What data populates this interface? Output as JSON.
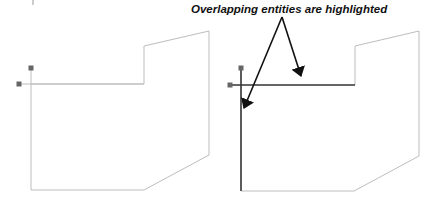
{
  "caption": "Overlapping entities are highlighted",
  "colors": {
    "normal_line": "#bdbdbd",
    "highlight_line": "#333333",
    "grip": "#666666",
    "arrow": "#111111",
    "background": "#ffffff"
  },
  "panels": [
    {
      "name": "before",
      "outline_points": "31,84 144,84 144,46 209,31 209,155 144,190 31,190",
      "vertical_line": {
        "x": 31,
        "y1": 70,
        "y2": 190
      },
      "horizontal_line": {
        "x1": 21,
        "x2": 144,
        "y": 84
      },
      "grips": [
        {
          "x": 31,
          "y": 68
        },
        {
          "x": 19,
          "y": 84
        }
      ],
      "highlighted": false
    },
    {
      "name": "after",
      "outline_points": "355,85 355,46 419,31 419,156 354,191 241,191",
      "vertical_line": {
        "x": 241,
        "y1": 70,
        "y2": 191
      },
      "horizontal_line": {
        "x1": 232,
        "x2": 355,
        "y": 85
      },
      "grips": [
        {
          "x": 241,
          "y": 68
        },
        {
          "x": 230,
          "y": 85
        }
      ],
      "highlighted": true
    }
  ],
  "arrows": [
    {
      "from": {
        "x": 282,
        "y": 17
      },
      "to": {
        "x": 301,
        "y": 76
      }
    },
    {
      "from": {
        "x": 282,
        "y": 17
      },
      "to": {
        "x": 244,
        "y": 108
      }
    }
  ]
}
